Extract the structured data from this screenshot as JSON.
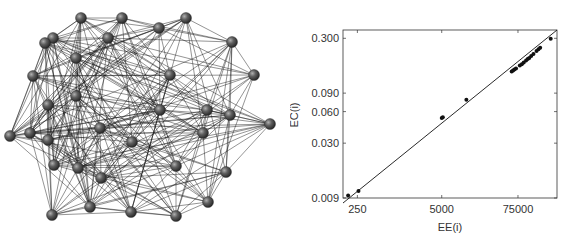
{
  "figure": {
    "left_panel": {
      "type": "network-graph",
      "node_color": "#555555",
      "edge_color": "#111111",
      "nodes": [
        [
          81,
          18
        ],
        [
          122,
          18
        ],
        [
          186,
          18
        ],
        [
          53,
          38
        ],
        [
          108,
          38
        ],
        [
          159,
          28
        ],
        [
          232,
          42
        ],
        [
          76,
          58
        ],
        [
          33,
          76
        ],
        [
          48,
          105
        ],
        [
          76,
          96
        ],
        [
          170,
          75
        ],
        [
          254,
          75
        ],
        [
          30,
          133
        ],
        [
          48,
          140
        ],
        [
          100,
          128
        ],
        [
          160,
          110
        ],
        [
          207,
          110
        ],
        [
          270,
          124
        ],
        [
          101,
          178
        ],
        [
          230,
          115
        ],
        [
          54,
          165
        ],
        [
          78,
          168
        ],
        [
          203,
          133
        ],
        [
          132,
          142
        ],
        [
          176,
          166
        ],
        [
          226,
          172
        ],
        [
          90,
          207
        ],
        [
          131,
          212
        ],
        [
          176,
          216
        ],
        [
          208,
          202
        ],
        [
          52,
          215
        ],
        [
          10,
          136
        ],
        [
          45,
          43
        ]
      ]
    },
    "right_panel": {
      "title": "",
      "xlabel": "EE(i)",
      "ylabel": "EC(i)"
    }
  },
  "chart_data": {
    "type": "scatter",
    "title": "",
    "xlabel": "EE(i)",
    "ylabel": "EC(i)",
    "xscale": "log",
    "yscale": "log",
    "x_ticks": [
      250,
      5000,
      75000
    ],
    "y_ticks": [
      0.009,
      0.03,
      0.06,
      0.09,
      0.3
    ],
    "x_tick_labels": [
      "250",
      "5000",
      "75000"
    ],
    "y_tick_labels": [
      "0.009",
      "0.030",
      "0.060",
      "0.090",
      "0.300"
    ],
    "xlim": [
      150,
      300000
    ],
    "ylim": [
      0.009,
      0.36
    ],
    "grid": false,
    "legend": null,
    "fit_line": "y proportional to x (diagonal line through data)",
    "series": [
      {
        "name": "nodes",
        "points": [
          [
            180,
            0.0095
          ],
          [
            260,
            0.0105
          ],
          [
            5000,
            0.052
          ],
          [
            5200,
            0.053
          ],
          [
            12000,
            0.078
          ],
          [
            60000,
            0.145
          ],
          [
            63000,
            0.148
          ],
          [
            66000,
            0.151
          ],
          [
            70000,
            0.155
          ],
          [
            80000,
            0.165
          ],
          [
            86000,
            0.17
          ],
          [
            92000,
            0.176
          ],
          [
            100000,
            0.184
          ],
          [
            106000,
            0.19
          ],
          [
            112000,
            0.195
          ],
          [
            120000,
            0.203
          ],
          [
            130000,
            0.212
          ],
          [
            145000,
            0.227
          ],
          [
            155000,
            0.236
          ],
          [
            165000,
            0.244
          ],
          [
            240000,
            0.297
          ]
        ]
      }
    ]
  }
}
